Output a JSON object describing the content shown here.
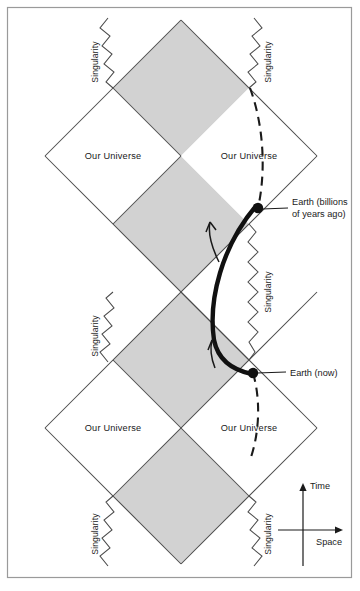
{
  "figure": {
    "colors": {
      "shaded_region": "#d2d2d2",
      "line": "#4a4a4a",
      "ink": "#1a1a1a",
      "frame": "#9a9a9a",
      "background": "#ffffff"
    },
    "frame": {
      "x": 7,
      "y": 7,
      "width": 345,
      "height": 571
    }
  },
  "regions": [
    {
      "id": "universe-top-left",
      "label": "Our Universe",
      "cx": 113,
      "cy": 156,
      "shaded": false
    },
    {
      "id": "universe-top-right",
      "label": "Our Universe",
      "cx": 249,
      "cy": 156,
      "shaded": false
    },
    {
      "id": "universe-bottom-left",
      "label": "Our Universe",
      "cx": 113,
      "cy": 428,
      "shaded": false
    },
    {
      "id": "universe-bottom-right",
      "label": "Our Universe",
      "cx": 249,
      "cy": 428,
      "shaded": false
    },
    {
      "id": "black-hole-interior-top",
      "cx": 181,
      "cy": 88,
      "shaded": true
    },
    {
      "id": "wormhole-interior-upper",
      "cx": 181,
      "cy": 224,
      "shaded": true
    },
    {
      "id": "wormhole-interior-lower",
      "cx": 181,
      "cy": 360,
      "shaded": true
    },
    {
      "id": "black-hole-interior-bottom",
      "cx": 181,
      "cy": 496,
      "shaded": true
    }
  ],
  "singularities": [
    {
      "id": "singularity-top-left",
      "label": "Singularity",
      "label_x": 98,
      "label_y": 62,
      "rotate": -90
    },
    {
      "id": "singularity-top-right",
      "label": "Singularity",
      "label_x": 268,
      "label_y": 62,
      "rotate": -90
    },
    {
      "id": "singularity-mid-left",
      "label": "Singularity",
      "label_x": 98,
      "label_y": 334,
      "rotate": -90
    },
    {
      "id": "singularity-mid-right",
      "label": "Singularity",
      "label_x": 268,
      "label_y": 266,
      "rotate": -90
    },
    {
      "id": "singularity-bottom-left",
      "label": "Singularity",
      "label_x": 98,
      "label_y": 534,
      "rotate": -90
    },
    {
      "id": "singularity-bottom-right",
      "label": "Singularity",
      "label_x": 268,
      "label_y": 534,
      "rotate": -90
    }
  ],
  "events": [
    {
      "id": "earth-past",
      "label_line1": "Earth (billions",
      "label_line2": "of years ago)",
      "dot_x": 258,
      "dot_y": 208,
      "leader_to_x": 288,
      "leader_to_y": 208,
      "label_x": 292,
      "label_y": 205
    },
    {
      "id": "earth-now",
      "label_line1": "Earth (now)",
      "label_line2": "",
      "dot_x": 253,
      "dot_y": 373,
      "leader_to_x": 286,
      "leader_to_y": 372,
      "label_x": 290,
      "label_y": 375
    }
  ],
  "trajectories": [
    {
      "id": "earth-worldline-dashed-upper",
      "style": "dashed",
      "description": "Earth world line approaching from the past singularity crossing toward Earth (billions of years ago)"
    },
    {
      "id": "earth-worldline-dashed-lower",
      "style": "dashed",
      "description": "Earth world line continuing from Earth (now) toward the future"
    },
    {
      "id": "wormhole-traverse-path",
      "style": "solid-thick",
      "description": "Path through the wormhole throat from Earth (billions of years ago) to Earth (now)"
    }
  ],
  "arrows": [
    {
      "id": "traverse-arrow-upper",
      "direction": "up-left"
    },
    {
      "id": "traverse-arrow-lower",
      "direction": "up-left"
    }
  ],
  "axes": {
    "time_label": "Time",
    "space_label": "Space",
    "origin_x": 303,
    "origin_y": 530,
    "time_tip_y": 484,
    "space_tip_x": 345
  }
}
